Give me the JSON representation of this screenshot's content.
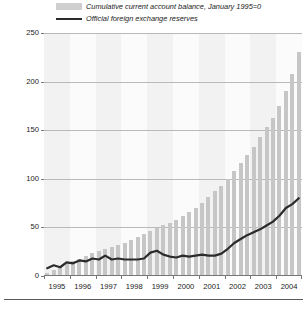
{
  "chart_data": {
    "type": "bar",
    "title": "",
    "subtitle": "",
    "xlabel": "",
    "ylabel": "",
    "ylim": [
      0,
      250
    ],
    "yticks": [
      0,
      50,
      100,
      150,
      200,
      250
    ],
    "grid": true,
    "legend_position": "top",
    "categories": [
      "1995Q1",
      "1995Q2",
      "1995Q3",
      "1995Q4",
      "1996Q1",
      "1996Q2",
      "1996Q3",
      "1996Q4",
      "1997Q1",
      "1997Q2",
      "1997Q3",
      "1997Q4",
      "1998Q1",
      "1998Q2",
      "1998Q3",
      "1998Q4",
      "1999Q1",
      "1999Q2",
      "1999Q3",
      "1999Q4",
      "2000Q1",
      "2000Q2",
      "2000Q3",
      "2000Q4",
      "2001Q1",
      "2001Q2",
      "2001Q3",
      "2001Q4",
      "2002Q1",
      "2002Q2",
      "2002Q3",
      "2002Q4",
      "2003Q1",
      "2003Q2",
      "2003Q3",
      "2003Q4",
      "2004Q1",
      "2004Q2",
      "2004Q3",
      "2004Q4"
    ],
    "xtick_labels": [
      "1995",
      "1996",
      "1997",
      "1998",
      "1999",
      "2000",
      "2001",
      "2002",
      "2003",
      "2004"
    ],
    "series": [
      {
        "name": "Cumulative current  account balance, January 1995=0",
        "type": "bar",
        "color": "#c6c6c6",
        "values": [
          3,
          6,
          9,
          12,
          15,
          18,
          21,
          24,
          26,
          28,
          30,
          32,
          34,
          37,
          40,
          43,
          46,
          49,
          52,
          55,
          58,
          62,
          66,
          70,
          75,
          81,
          87,
          93,
          100,
          108,
          116,
          124,
          133,
          143,
          153,
          163,
          175,
          190,
          208,
          230
        ]
      },
      {
        "name": "Official foreign exchange reserves",
        "type": "line",
        "color": "#2b2b2b",
        "values": [
          8,
          11,
          9,
          14,
          13,
          16,
          15,
          18,
          17,
          21,
          17,
          18,
          17,
          17,
          17,
          18,
          24,
          26,
          22,
          20,
          19,
          21,
          20,
          21,
          22,
          21,
          21,
          23,
          28,
          34,
          38,
          42,
          45,
          48,
          52,
          56,
          62,
          70,
          74,
          80
        ]
      }
    ]
  },
  "legend": {
    "items": [
      {
        "label": "Cumulative current  account balance, January 1995=0",
        "marker": "bar-swatch"
      },
      {
        "label": "Official foreign exchange reserves",
        "marker": "line-swatch"
      }
    ]
  }
}
